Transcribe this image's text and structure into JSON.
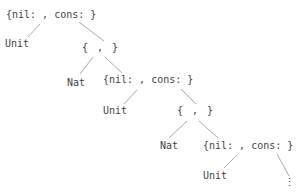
{
  "diagram": {
    "description_labels": {
      "record_label": "{nil: , cons: }",
      "pair_label": "{ , }",
      "unit_label": "Unit",
      "nat_label": "Nat",
      "continuation_label": "⋮"
    },
    "colors": {
      "background": "#ffffff",
      "text": "#3f3f3f",
      "edge": "#a2a2a2"
    },
    "nodes": [
      {
        "id": "record-1",
        "label": "{nil: , cons: }",
        "x": 6,
        "y": 8
      },
      {
        "id": "unit-1",
        "label": "Unit",
        "x": 5,
        "y": 37
      },
      {
        "id": "pair-1",
        "label": "{ , }",
        "x": 82,
        "y": 41
      },
      {
        "id": "nat-1",
        "label": "Nat",
        "x": 67,
        "y": 76
      },
      {
        "id": "record-2",
        "label": "{nil: , cons: }",
        "x": 103,
        "y": 73
      },
      {
        "id": "unit-2",
        "label": "Unit",
        "x": 103,
        "y": 104
      },
      {
        "id": "pair-2",
        "label": "{ , }",
        "x": 177,
        "y": 104
      },
      {
        "id": "nat-2",
        "label": "Nat",
        "x": 160,
        "y": 139
      },
      {
        "id": "record-3",
        "label": "{nil: , cons: }",
        "x": 203,
        "y": 139
      },
      {
        "id": "unit-3",
        "label": "Unit",
        "x": 203,
        "y": 169
      },
      {
        "id": "ellipsis",
        "label": "⋮",
        "x": 284,
        "y": 176
      }
    ],
    "edges": [
      {
        "from": "record-1",
        "to": "unit-1",
        "x1": 40,
        "y1": 24,
        "x2": 28,
        "y2": 37
      },
      {
        "from": "record-1",
        "to": "pair-1",
        "x1": 79,
        "y1": 22,
        "x2": 104,
        "y2": 41
      },
      {
        "from": "pair-1",
        "to": "nat-1",
        "x1": 93,
        "y1": 57,
        "x2": 80,
        "y2": 74
      },
      {
        "from": "pair-1",
        "to": "record-2",
        "x1": 105,
        "y1": 57,
        "x2": 122,
        "y2": 73
      },
      {
        "from": "record-2",
        "to": "unit-2",
        "x1": 137,
        "y1": 90,
        "x2": 124,
        "y2": 104
      },
      {
        "from": "record-2",
        "to": "pair-2",
        "x1": 181,
        "y1": 89,
        "x2": 196,
        "y2": 104
      },
      {
        "from": "pair-2",
        "to": "nat-2",
        "x1": 187,
        "y1": 121,
        "x2": 169,
        "y2": 138
      },
      {
        "from": "pair-2",
        "to": "record-3",
        "x1": 199,
        "y1": 121,
        "x2": 218,
        "y2": 138
      },
      {
        "from": "record-3",
        "to": "unit-3",
        "x1": 237,
        "y1": 155,
        "x2": 224,
        "y2": 168
      },
      {
        "from": "record-3",
        "to": "ellipsis",
        "x1": 277,
        "y1": 154,
        "x2": 289,
        "y2": 176
      }
    ]
  }
}
